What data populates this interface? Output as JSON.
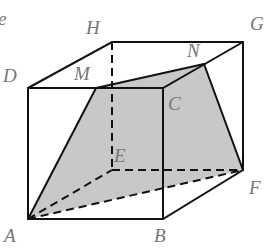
{
  "figure": {
    "corner_text": "e",
    "shaded_color": "#c8c8c8",
    "vertices": {
      "A": {
        "label": "A",
        "x": 28,
        "y": 219
      },
      "B": {
        "label": "B",
        "x": 163,
        "y": 219
      },
      "C": {
        "label": "C",
        "x": 163,
        "y": 88
      },
      "D": {
        "label": "D",
        "x": 28,
        "y": 88
      },
      "E": {
        "label": "E",
        "x": 111,
        "y": 170
      },
      "F": {
        "label": "F",
        "x": 243,
        "y": 170
      },
      "G": {
        "label": "G",
        "x": 243,
        "y": 42
      },
      "H": {
        "label": "H",
        "x": 112,
        "y": 42
      },
      "M": {
        "label": "M",
        "x": 96,
        "y": 88
      },
      "N": {
        "label": "N",
        "x": 204,
        "y": 64
      }
    },
    "shaded_face": [
      "A",
      "M",
      "N",
      "F"
    ]
  }
}
